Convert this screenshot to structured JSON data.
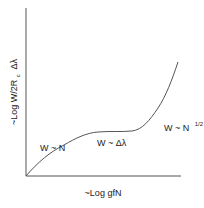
{
  "diagram": {
    "type": "curve-of-growth",
    "x_axis_label": "~Log gfN",
    "y_axis_label_prefix": "~Log W/2R",
    "y_axis_label_subscript": "c",
    "y_axis_label_suffix": "Δλ",
    "regions": [
      {
        "label": "W ~ N",
        "regime": "linear"
      },
      {
        "label": "W ~ Δλ",
        "regime": "flat"
      },
      {
        "label_base": "W ~ N",
        "label_superscript": "1/2",
        "regime": "square-root"
      }
    ],
    "colors": {
      "axis": "#555555",
      "curve": "#555555",
      "text": "#222222",
      "background": "#ffffff"
    }
  }
}
